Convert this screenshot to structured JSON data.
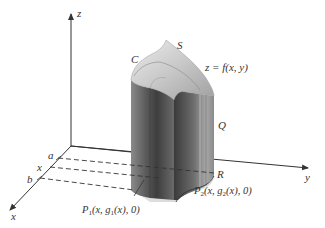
{
  "figure": {
    "colors": {
      "axis": "#333333",
      "label": "#333333",
      "solid_dark": "#4a4a4a",
      "solid_mid": "#7a7a7a",
      "solid_light": "#b8b8b8",
      "surface_top": "#d4d4d4",
      "base": "#e2e2e2",
      "background": "#ffffff"
    }
  },
  "axes": {
    "z_label": "z",
    "y_label": "y",
    "x_label": "x"
  },
  "x_axis_marks": {
    "a": "a",
    "x": "x",
    "b": "b"
  },
  "surface_labels": {
    "C": "C",
    "S": "S",
    "surface_eq": "z = f(x, y)",
    "Q": "Q",
    "R": "R"
  },
  "points": {
    "P1": {
      "name": "P",
      "sub": "1",
      "coords_pre": "(x, g",
      "coords_sub": "1",
      "coords_post": "(x), 0)"
    },
    "P2": {
      "name": "P",
      "sub": "2",
      "coords_pre": "(x, g",
      "coords_sub": "2",
      "coords_post": "(x), 0)"
    }
  }
}
